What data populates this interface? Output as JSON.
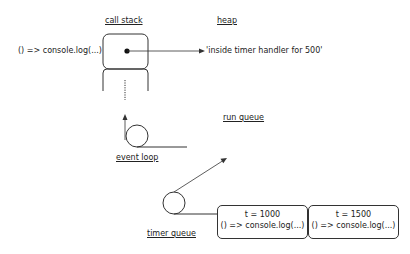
{
  "labels": {
    "call_stack": "call stack",
    "heap": "heap",
    "run_queue": "run queue",
    "event_loop": "event loop",
    "timer_queue": "timer queue"
  },
  "call_stack": {
    "frame_label": "() => console.log(...)"
  },
  "heap": {
    "value": "'inside timer handler for 500'"
  },
  "timer_queue": {
    "items": [
      {
        "time": "t = 1000",
        "callback": "() => console.log(...)"
      },
      {
        "time": "t = 1500",
        "callback": "() => console.log(...)"
      }
    ]
  }
}
